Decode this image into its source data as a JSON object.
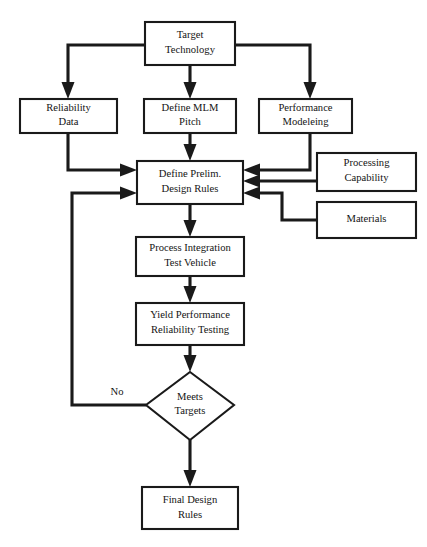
{
  "diagram": {
    "type": "flowchart",
    "nodes": [
      {
        "id": "target_technology",
        "shape": "rectangle",
        "lines": [
          "Target",
          "Technology"
        ]
      },
      {
        "id": "reliability_data",
        "shape": "rectangle",
        "lines": [
          "Reliability",
          "Data"
        ]
      },
      {
        "id": "define_mlm_pitch",
        "shape": "rectangle",
        "lines": [
          "Define MLM",
          "Pitch"
        ]
      },
      {
        "id": "performance_modeleing",
        "shape": "rectangle",
        "lines": [
          "Performance",
          "Modeleing"
        ]
      },
      {
        "id": "define_prelim_design_rules",
        "shape": "rectangle",
        "lines": [
          "Define Prelim.",
          "Design Rules"
        ]
      },
      {
        "id": "processing_capability",
        "shape": "rectangle",
        "lines": [
          "Processing",
          "Capability"
        ]
      },
      {
        "id": "materials",
        "shape": "rectangle",
        "lines": [
          "Materials"
        ]
      },
      {
        "id": "process_integration_test_vehicle",
        "shape": "rectangle",
        "lines": [
          "Process Integration",
          "Test Vehicle"
        ]
      },
      {
        "id": "yield_performance_reliability_testing",
        "shape": "rectangle",
        "lines": [
          "Yield Performance",
          "Reliability Testing"
        ]
      },
      {
        "id": "meets_targets",
        "shape": "diamond",
        "lines": [
          "Meets",
          "Targets"
        ]
      },
      {
        "id": "final_design_rules",
        "shape": "rectangle",
        "lines": [
          "Final Design",
          "Rules"
        ]
      }
    ],
    "edge_labels": {
      "no": "No"
    },
    "colors": {
      "stroke": "#1a1a1a",
      "fill": "#ffffff",
      "text": "#141414"
    }
  }
}
